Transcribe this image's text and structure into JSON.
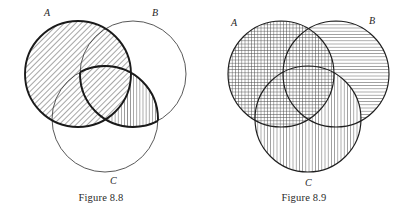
{
  "page": {
    "background_color": "#ffffff",
    "ink_color": "#2a2a2a",
    "figure_count": 2
  },
  "figures": [
    {
      "id": "figure-8-8",
      "caption": "Figure 8.8",
      "labels": {
        "a": "A",
        "b": "B",
        "c": "C"
      },
      "shaded_description": "A union (B intersect C)",
      "circles": [
        {
          "name": "A",
          "cx": 78,
          "cy": 72,
          "r": 53,
          "outline": "bold",
          "fill_pattern": "diagonal-hatch"
        },
        {
          "name": "B",
          "cx": 133,
          "cy": 72,
          "r": 53,
          "outline": "thin",
          "fill_pattern": "none"
        },
        {
          "name": "C",
          "cx": 105,
          "cy": 117,
          "r": 53,
          "outline": "thin",
          "fill_pattern": "none"
        }
      ],
      "shaded_regions": [
        {
          "region": "A",
          "pattern": "diagonal-hatch"
        },
        {
          "region": "B-intersect-C",
          "pattern": "vertical-hatch"
        },
        {
          "region": "A-intersect-B-intersect-C",
          "pattern": "cross-dense-hatch"
        }
      ]
    },
    {
      "id": "figure-8-9",
      "caption": "Figure 8.9",
      "labels": {
        "a": "A",
        "b": "B",
        "c": "C"
      },
      "shaded_description": "A union B union C",
      "circles": [
        {
          "name": "A",
          "cx": 78,
          "cy": 72,
          "r": 53,
          "outline": "thin",
          "fill_pattern": "grid-hatch"
        },
        {
          "name": "B",
          "cx": 133,
          "cy": 72,
          "r": 53,
          "outline": "thin",
          "fill_pattern": "horizontal-hatch"
        },
        {
          "name": "C",
          "cx": 105,
          "cy": 117,
          "r": 53,
          "outline": "thin",
          "fill_pattern": "vertical-hatch"
        }
      ],
      "shaded_regions": [
        {
          "region": "A",
          "pattern": "grid-hatch"
        },
        {
          "region": "B",
          "pattern": "horizontal-hatch"
        },
        {
          "region": "C",
          "pattern": "vertical-hatch"
        }
      ]
    }
  ]
}
